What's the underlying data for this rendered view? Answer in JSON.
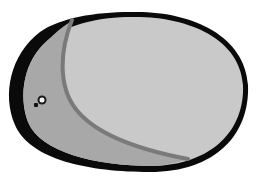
{
  "image": {
    "description": "Grayscale drawing of an egg-shaped oval with a thick black rim, a light gray interior and a darker gray crescent region on the left separated by a curved gray line; a small dark speck near the left edge.",
    "colors": {
      "background": "#ffffff",
      "outline": "#0a0a0a",
      "inner_fill": "#c9c9c9",
      "crescent_fill": "#a8a8a8",
      "divider_line": "#7a7a7a",
      "speck_dark": "#111111",
      "speck_light": "#f2f2f2"
    }
  }
}
